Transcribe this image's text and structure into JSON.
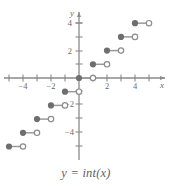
{
  "figure": {
    "caption": "y = int(x)",
    "caption_parts": {
      "lhs": "y",
      "eq": "=",
      "rhs": "int(x)"
    }
  },
  "chart_data": {
    "type": "line",
    "subtype": "step-function",
    "title": "y = int(x)",
    "xlabel": "x",
    "ylabel": "y",
    "xlim": [
      -5.6,
      5.7
    ],
    "ylim": [
      -5.6,
      5.2
    ],
    "grid": false,
    "legend": null,
    "x_ticks": [
      -4,
      -2,
      2,
      4
    ],
    "x_tick_labels": [
      "−4",
      "−2",
      "2",
      "4"
    ],
    "x_minor_ticks": [
      -5,
      -3,
      -1,
      1,
      3,
      5
    ],
    "y_ticks": [
      -4,
      -2,
      2,
      4
    ],
    "y_tick_labels": [
      "−4",
      "−2",
      "2",
      "4"
    ],
    "y_minor_ticks": [
      -5,
      -3,
      -1,
      1,
      3,
      5
    ],
    "colors": {
      "axis": "#8a8a8a",
      "segment": "#9a9a9a",
      "closed_dot": "#6e6e6e",
      "open_dot_stroke": "#8c8c8c",
      "open_dot_fill": "#ffffff",
      "text": "#6b6b6b",
      "background": "#ffffff"
    },
    "segments": [
      {
        "y": 4,
        "x_start": 4,
        "x_end": 5,
        "start_closed": true,
        "end_closed": false
      },
      {
        "y": 3,
        "x_start": 3,
        "x_end": 4,
        "start_closed": true,
        "end_closed": false
      },
      {
        "y": 2,
        "x_start": 2,
        "x_end": 3,
        "start_closed": true,
        "end_closed": false
      },
      {
        "y": 1,
        "x_start": 1,
        "x_end": 2,
        "start_closed": true,
        "end_closed": false
      },
      {
        "y": 0,
        "x_start": 0,
        "x_end": 1,
        "start_closed": true,
        "end_closed": false
      },
      {
        "y": -1,
        "x_start": -1,
        "x_end": 0,
        "start_closed": true,
        "end_closed": false
      },
      {
        "y": -2,
        "x_start": -2,
        "x_end": -1,
        "start_closed": true,
        "end_closed": false
      },
      {
        "y": -3,
        "x_start": -3,
        "x_end": -2,
        "start_closed": true,
        "end_closed": false
      },
      {
        "y": -4,
        "x_start": -4,
        "x_end": -3,
        "start_closed": true,
        "end_closed": false
      },
      {
        "y": -5,
        "x_start": -5,
        "x_end": -4,
        "start_closed": true,
        "end_closed": false
      }
    ]
  }
}
